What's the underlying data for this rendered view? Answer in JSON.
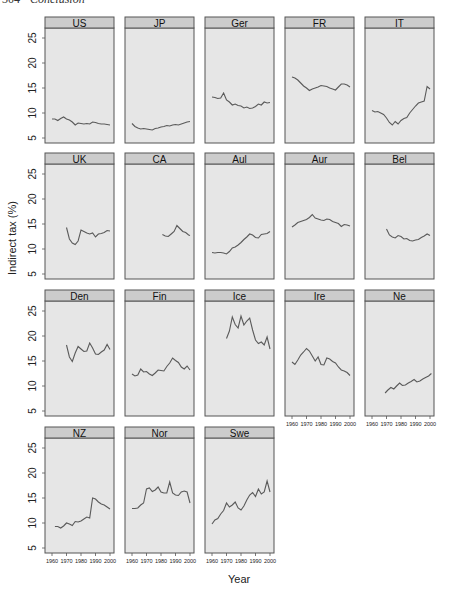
{
  "page_header": {
    "number": "304",
    "title": "Conclusion"
  },
  "chart_data": {
    "type": "line",
    "title": "",
    "xlabel": "Year",
    "ylabel": "Indirect tax (%)",
    "xlim": [
      1960,
      2002
    ],
    "ylim": [
      4,
      27
    ],
    "xticks": [
      1960,
      1970,
      1980,
      1990,
      2000
    ],
    "yticks": [
      5,
      10,
      15,
      20,
      25
    ],
    "grid": false,
    "layout": {
      "rows": 4,
      "cols": 5
    },
    "colors": {
      "line": "#5a5a5a",
      "panel_bg": "#e6e6e6",
      "strip_bg": "#cccccc",
      "border": "#555555"
    },
    "panels": [
      {
        "name": "US",
        "x": [
          1960,
          1962,
          1964,
          1966,
          1968,
          1970,
          1972,
          1974,
          1976,
          1978,
          1980,
          1982,
          1984,
          1986,
          1988,
          1990,
          1992,
          1994,
          1996,
          1998,
          2000
        ],
        "y": [
          8.8,
          8.8,
          8.5,
          8.9,
          9.2,
          8.8,
          8.6,
          8.2,
          7.6,
          8.0,
          7.9,
          7.8,
          7.9,
          7.8,
          8.2,
          8.1,
          7.9,
          7.8,
          7.8,
          7.7,
          7.6
        ]
      },
      {
        "name": "JP",
        "x": [
          1960,
          1962,
          1964,
          1966,
          1968,
          1970,
          1972,
          1974,
          1976,
          1978,
          1980,
          1982,
          1984,
          1986,
          1988,
          1990,
          1992,
          1994,
          1996,
          1998,
          2000
        ],
        "y": [
          7.9,
          7.3,
          7.0,
          6.8,
          6.9,
          6.8,
          6.7,
          6.6,
          6.9,
          7.0,
          7.2,
          7.3,
          7.5,
          7.4,
          7.6,
          7.7,
          7.6,
          7.8,
          8.0,
          8.2,
          8.3
        ]
      },
      {
        "name": "Ger",
        "x": [
          1960,
          1962,
          1964,
          1966,
          1968,
          1970,
          1972,
          1974,
          1976,
          1978,
          1980,
          1982,
          1984,
          1986,
          1988,
          1990,
          1992,
          1994,
          1996,
          1998,
          2000
        ],
        "y": [
          13.2,
          13.1,
          12.9,
          13.0,
          14.0,
          12.6,
          12.2,
          11.6,
          11.8,
          11.5,
          11.4,
          11.0,
          11.2,
          10.9,
          11.0,
          11.3,
          11.8,
          11.6,
          12.2,
          12.0,
          12.1
        ]
      },
      {
        "name": "FR",
        "x": [
          1960,
          1962,
          1964,
          1966,
          1968,
          1970,
          1972,
          1974,
          1976,
          1978,
          1980,
          1982,
          1984,
          1986,
          1988,
          1990,
          1992,
          1994,
          1996,
          1998,
          2000
        ],
        "y": [
          17.2,
          17.0,
          16.6,
          16.0,
          15.4,
          15.0,
          14.5,
          14.8,
          15.0,
          15.2,
          15.5,
          15.4,
          15.3,
          15.0,
          14.8,
          14.6,
          15.2,
          15.8,
          15.8,
          15.6,
          15.2
        ]
      },
      {
        "name": "IT",
        "x": [
          1960,
          1962,
          1964,
          1966,
          1968,
          1970,
          1972,
          1974,
          1976,
          1978,
          1980,
          1982,
          1984,
          1986,
          1988,
          1990,
          1992,
          1994,
          1996,
          1998,
          2000
        ],
        "y": [
          10.5,
          10.2,
          10.3,
          10.0,
          9.7,
          9.0,
          8.1,
          7.6,
          8.3,
          7.8,
          8.5,
          8.9,
          9.1,
          10.0,
          10.7,
          11.4,
          12.0,
          12.2,
          12.4,
          15.3,
          14.8
        ]
      },
      {
        "name": "UK",
        "x": [
          1970,
          1972,
          1974,
          1976,
          1978,
          1980,
          1982,
          1984,
          1986,
          1988,
          1990,
          1992,
          1994,
          1996,
          1998,
          2000
        ],
        "y": [
          14.3,
          12.0,
          11.2,
          10.9,
          11.6,
          13.8,
          13.5,
          13.2,
          13.0,
          13.2,
          12.4,
          13.0,
          13.1,
          13.3,
          13.7,
          13.6
        ]
      },
      {
        "name": "CA",
        "x": [
          1981,
          1983,
          1985,
          1987,
          1989,
          1991,
          1993,
          1995,
          1997,
          1999,
          2000
        ],
        "y": [
          12.9,
          12.6,
          12.5,
          13.0,
          13.5,
          14.7,
          14.1,
          13.5,
          13.3,
          12.8,
          12.7
        ]
      },
      {
        "name": "Aul",
        "x": [
          1960,
          1962,
          1964,
          1966,
          1968,
          1970,
          1972,
          1974,
          1976,
          1978,
          1980,
          1982,
          1984,
          1986,
          1988,
          1990,
          1992,
          1994,
          1996,
          1998,
          2000
        ],
        "y": [
          9.3,
          9.2,
          9.3,
          9.3,
          9.2,
          9.0,
          9.5,
          10.2,
          10.4,
          10.8,
          11.3,
          11.9,
          12.4,
          13.0,
          12.8,
          12.3,
          12.2,
          12.9,
          13.0,
          13.1,
          13.5
        ]
      },
      {
        "name": "Aur",
        "x": [
          1960,
          1962,
          1964,
          1966,
          1968,
          1970,
          1972,
          1974,
          1976,
          1978,
          1980,
          1982,
          1984,
          1986,
          1988,
          1990,
          1992,
          1994,
          1996,
          1998,
          2000
        ],
        "y": [
          14.4,
          14.8,
          15.3,
          15.5,
          15.7,
          15.9,
          16.3,
          16.9,
          16.2,
          16.0,
          15.8,
          15.7,
          16.0,
          15.9,
          15.5,
          15.3,
          15.1,
          14.5,
          14.9,
          14.8,
          14.6
        ]
      },
      {
        "name": "Bel",
        "x": [
          1970,
          1972,
          1974,
          1976,
          1978,
          1980,
          1982,
          1984,
          1986,
          1988,
          1990,
          1992,
          1994,
          1996,
          1998,
          2000
        ],
        "y": [
          14.0,
          12.8,
          12.4,
          12.2,
          12.7,
          12.5,
          12.0,
          12.1,
          11.7,
          11.6,
          11.8,
          11.9,
          12.3,
          12.6,
          13.0,
          12.7
        ]
      },
      {
        "name": "Den",
        "x": [
          1970,
          1972,
          1974,
          1976,
          1978,
          1980,
          1982,
          1984,
          1986,
          1988,
          1990,
          1992,
          1994,
          1996,
          1998,
          2000
        ],
        "y": [
          18.2,
          15.8,
          14.9,
          16.6,
          17.9,
          17.4,
          16.9,
          17.0,
          18.6,
          17.6,
          16.4,
          16.3,
          16.8,
          17.2,
          18.3,
          17.3
        ]
      },
      {
        "name": "Fin",
        "x": [
          1960,
          1962,
          1964,
          1966,
          1968,
          1970,
          1972,
          1974,
          1976,
          1978,
          1980,
          1982,
          1984,
          1986,
          1988,
          1990,
          1992,
          1994,
          1996,
          1998,
          2000
        ],
        "y": [
          12.4,
          12.0,
          12.2,
          13.4,
          12.8,
          12.9,
          12.4,
          12.1,
          12.6,
          13.2,
          13.1,
          13.0,
          13.9,
          14.6,
          15.6,
          15.1,
          14.7,
          13.8,
          13.4,
          14.0,
          13.2
        ]
      },
      {
        "name": "Ice",
        "x": [
          1970,
          1972,
          1974,
          1976,
          1978,
          1980,
          1982,
          1984,
          1986,
          1988,
          1990,
          1992,
          1994,
          1996,
          1998,
          2000
        ],
        "y": [
          19.5,
          21.0,
          23.8,
          22.3,
          21.6,
          24.0,
          22.2,
          23.0,
          23.6,
          21.2,
          19.2,
          18.5,
          18.8,
          18.2,
          19.8,
          17.4
        ]
      },
      {
        "name": "Ire",
        "x": [
          1960,
          1962,
          1964,
          1966,
          1968,
          1970,
          1972,
          1974,
          1976,
          1978,
          1980,
          1982,
          1984,
          1986,
          1988,
          1990,
          1992,
          1994,
          1996,
          1998,
          2000
        ],
        "y": [
          14.8,
          14.3,
          15.2,
          16.2,
          16.8,
          17.5,
          17.0,
          16.0,
          15.0,
          15.8,
          14.3,
          14.2,
          15.6,
          15.4,
          14.9,
          14.6,
          13.8,
          13.2,
          13.0,
          12.7,
          12.1
        ]
      },
      {
        "name": "Ne",
        "x": [
          1969,
          1971,
          1973,
          1975,
          1977,
          1979,
          1981,
          1983,
          1985,
          1987,
          1989,
          1991,
          1993,
          1995,
          1997,
          1999,
          2001
        ],
        "y": [
          8.6,
          9.2,
          9.7,
          9.4,
          10.0,
          10.6,
          10.1,
          10.2,
          10.6,
          10.9,
          11.3,
          10.8,
          11.0,
          11.4,
          11.7,
          12.0,
          12.5
        ]
      },
      {
        "name": "NZ",
        "x": [
          1962,
          1964,
          1966,
          1968,
          1970,
          1972,
          1974,
          1976,
          1978,
          1980,
          1982,
          1984,
          1986,
          1988,
          1990,
          1992,
          1994,
          1996,
          1998,
          2000
        ],
        "y": [
          9.3,
          9.3,
          9.0,
          9.4,
          10.0,
          9.8,
          9.5,
          10.3,
          10.2,
          10.4,
          10.8,
          11.2,
          11.0,
          15.0,
          14.8,
          14.2,
          13.8,
          13.6,
          13.2,
          12.8
        ]
      },
      {
        "name": "Nor",
        "x": [
          1960,
          1962,
          1964,
          1966,
          1968,
          1970,
          1972,
          1974,
          1976,
          1978,
          1980,
          1982,
          1984,
          1986,
          1988,
          1990,
          1992,
          1994,
          1996,
          1998,
          2000
        ],
        "y": [
          12.9,
          12.9,
          13.0,
          13.6,
          14.0,
          16.8,
          17.0,
          16.3,
          16.6,
          17.2,
          16.2,
          16.0,
          16.0,
          18.2,
          16.0,
          15.6,
          15.5,
          16.2,
          16.4,
          16.2,
          14.0
        ]
      },
      {
        "name": "Swe",
        "x": [
          1960,
          1962,
          1964,
          1966,
          1968,
          1970,
          1972,
          1974,
          1976,
          1978,
          1980,
          1982,
          1984,
          1986,
          1988,
          1990,
          1992,
          1994,
          1996,
          1998,
          2000
        ],
        "y": [
          9.8,
          10.6,
          10.9,
          11.8,
          12.5,
          14.0,
          13.2,
          13.6,
          14.2,
          13.0,
          12.6,
          13.4,
          14.6,
          15.6,
          16.1,
          15.3,
          16.8,
          15.8,
          16.2,
          18.4,
          16.2
        ]
      }
    ]
  }
}
